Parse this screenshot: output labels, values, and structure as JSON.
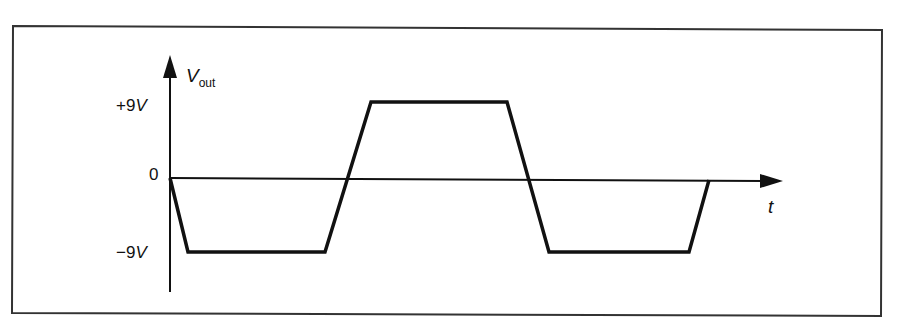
{
  "diagram": {
    "y_axis_label_main": "V",
    "y_axis_label_sub": "out",
    "x_axis_label": "t",
    "tick_labels": {
      "positive": "+9",
      "positive_unit": "V",
      "zero": "0",
      "negative": "−9",
      "negative_unit": "V"
    },
    "colors": {
      "stroke": "#111111",
      "background": "#ffffff",
      "frame": "#333333"
    },
    "waveform": {
      "type": "trapezoidal square wave",
      "levels_volts": [
        -9,
        0,
        9
      ],
      "points": [
        [
          170,
          178
        ],
        [
          188,
          252
        ],
        [
          325,
          252
        ],
        [
          371,
          102
        ],
        [
          507,
          102
        ],
        [
          549,
          252
        ],
        [
          689,
          252
        ],
        [
          709,
          180
        ]
      ]
    }
  }
}
